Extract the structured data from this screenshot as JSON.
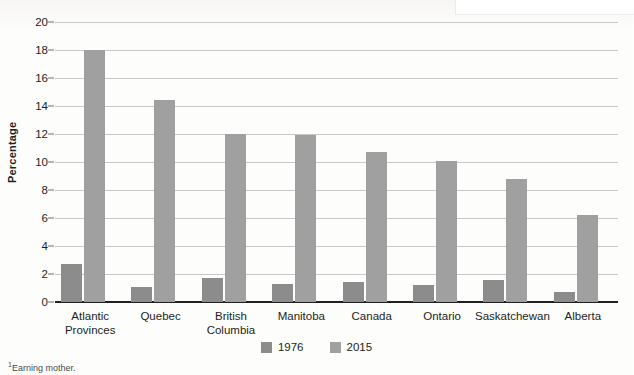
{
  "chart_data": {
    "type": "bar",
    "title": "",
    "xlabel": "",
    "ylabel": "Percentage",
    "ylim": [
      0,
      20
    ],
    "ytick_step": 2,
    "yticks": [
      0,
      2,
      4,
      6,
      8,
      10,
      12,
      14,
      16,
      18,
      20
    ],
    "grid": true,
    "legend_position": "bottom-center",
    "categories": [
      "Atlantic\nProvinces",
      "Quebec",
      "British\nColumbia",
      "Manitoba",
      "Canada",
      "Ontario",
      "Saskatchewan",
      "Alberta"
    ],
    "category_lines": [
      [
        "Atlantic",
        "Provinces"
      ],
      [
        "Quebec",
        ""
      ],
      [
        "British",
        "Columbia"
      ],
      [
        "Manitoba",
        ""
      ],
      [
        "Canada",
        ""
      ],
      [
        "Ontario",
        ""
      ],
      [
        "Saskatchewan",
        ""
      ],
      [
        "Alberta",
        ""
      ]
    ],
    "series": [
      {
        "name": "1976",
        "color": "#8c8c8c",
        "values": [
          2.7,
          1.1,
          1.7,
          1.3,
          1.4,
          1.2,
          1.6,
          0.7
        ]
      },
      {
        "name": "2015",
        "color": "#a0a0a0",
        "values": [
          18.0,
          14.4,
          12.0,
          11.9,
          10.7,
          10.1,
          8.8,
          6.2
        ]
      }
    ]
  },
  "footnote": {
    "marker": "1",
    "text": "Earning mother."
  },
  "colors": {
    "series_1976": "#8c8c8c",
    "series_2015": "#a0a0a0",
    "gridline": "#c9c9c9",
    "axis": "#231f20",
    "text": "#231f20"
  }
}
